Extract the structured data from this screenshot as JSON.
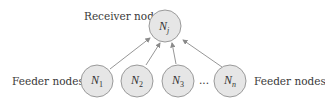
{
  "diagram": {
    "receiver": {
      "label": "Receiver node",
      "node_symbol": "N",
      "node_subscript": "j"
    },
    "feeders": [
      {
        "symbol": "N",
        "subscript": "1"
      },
      {
        "symbol": "N",
        "subscript": "2"
      },
      {
        "symbol": "N",
        "subscript": "3"
      },
      {
        "symbol": "N",
        "subscript": "n"
      }
    ],
    "ellipsis": "...",
    "feeder_label_left": "Feeder nodes",
    "feeder_label_right": "Feeder nodes",
    "colors": {
      "node_fill": "#e6e6e6",
      "node_stroke": "#9a9a9a",
      "edge": "#8a8a8a",
      "text": "#3a3a3a"
    }
  }
}
